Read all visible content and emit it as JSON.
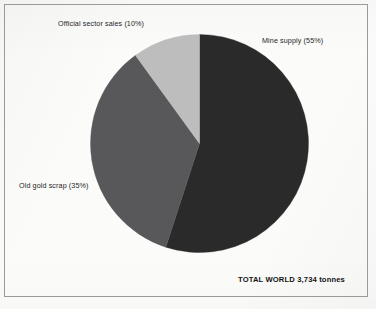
{
  "figure": {
    "background_color": "#fbfbf9",
    "border_color": "#9a9a9a",
    "total_note": "TOTAL WORLD 3,734 tonnes"
  },
  "labels": {
    "official_sector": "Official sector sales (10%)",
    "mine_supply": "Mine supply (55%)",
    "old_gold_scrap": "Old gold scrap (35%)"
  },
  "chart_data": {
    "type": "pie",
    "title": "",
    "subtitle": "",
    "xlabel": "",
    "ylabel": "",
    "grid": false,
    "legend_position": "none",
    "unit": "tonnes",
    "total_value": 3734,
    "total_label": "TOTAL WORLD 3,734 tonnes",
    "start_angle_deg": 0,
    "direction": "clockwise",
    "categories": [
      "Mine supply",
      "Old gold scrap",
      "Official sector sales"
    ],
    "values": [
      55,
      35,
      10
    ],
    "value_unit": "percent",
    "colors": [
      "#2a2a2a",
      "#58585a",
      "#bdbdbd"
    ],
    "slices": [
      {
        "name": "Mine supply",
        "percent": 55,
        "label": "Mine supply (55%)",
        "color": "#2a2a2a",
        "start_angle_deg": 0,
        "end_angle_deg": 198
      },
      {
        "name": "Old gold scrap",
        "percent": 35,
        "label": "Old gold scrap (35%)",
        "color": "#58585a",
        "start_angle_deg": 198,
        "end_angle_deg": 324
      },
      {
        "name": "Official sector sales",
        "percent": 10,
        "label": "Official sector sales (10%)",
        "color": "#bdbdbd",
        "start_angle_deg": 324,
        "end_angle_deg": 360
      }
    ]
  }
}
